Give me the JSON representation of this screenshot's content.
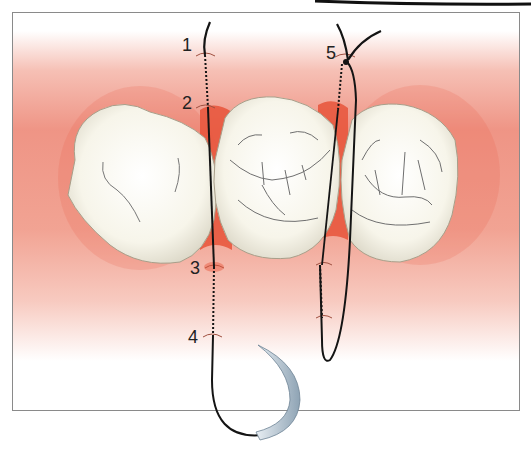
{
  "figure": {
    "labels": [
      {
        "id": "1",
        "text": "1",
        "x": 182,
        "y": 36
      },
      {
        "id": "2",
        "text": "2",
        "x": 182,
        "y": 94
      },
      {
        "id": "3",
        "text": "3",
        "x": 190,
        "y": 259
      },
      {
        "id": "4",
        "text": "4",
        "x": 188,
        "y": 328
      },
      {
        "id": "5",
        "text": "5",
        "x": 326,
        "y": 44
      }
    ],
    "elements": {
      "teeth": [
        "left-tooth",
        "middle-tooth",
        "right-tooth"
      ],
      "sutures": [
        "left-suture-with-needle",
        "right-suture-loop"
      ],
      "needle": "curved-needle"
    },
    "colors": {
      "gingiva": "#ee8c78",
      "gingiva_dark": "#e8543a",
      "tooth": "#fbf9ef",
      "suture": "#141414",
      "needle": "#a9bccb",
      "frame": "#8a8a8a"
    },
    "caption": ""
  }
}
